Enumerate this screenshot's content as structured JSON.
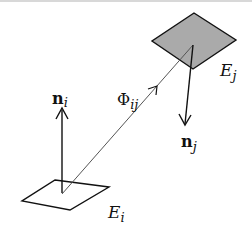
{
  "diagram": {
    "type": "radiosity-form-factor",
    "colors": {
      "stroke": "#111111",
      "patch_j_fill": "#aaaaaa",
      "patch_i_fill": "#ffffff",
      "ray": "#555555",
      "top_rule": "#d8d8d8"
    },
    "patches": [
      {
        "id": "Ei",
        "label_main": "E",
        "label_sub": "i",
        "filled": false
      },
      {
        "id": "Ej",
        "label_main": "E",
        "label_sub": "j",
        "filled": true
      }
    ],
    "normals": [
      {
        "id": "ni",
        "label_main": "n",
        "label_sub": "i",
        "direction": "up"
      },
      {
        "id": "nj",
        "label_main": "n",
        "label_sub": "j",
        "direction": "down"
      }
    ],
    "form_factor": {
      "label_main": "Φ",
      "label_sub": "ij",
      "from": "Ei",
      "to": "Ej"
    }
  }
}
